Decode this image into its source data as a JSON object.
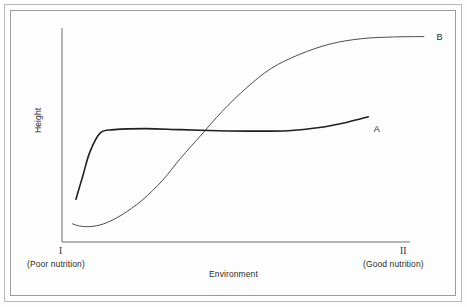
{
  "figure": {
    "background_color": "#fdfdfd",
    "frame_color": "#b9b9b9",
    "axis_color": "#6e6e6e"
  },
  "chart_data": {
    "type": "line",
    "title": "",
    "subtitle": "",
    "xlabel": "Environment",
    "ylabel": "Height",
    "grid": false,
    "legend": "none",
    "axis_ticks": "none",
    "xlim": [
      0,
      1
    ],
    "ylim": [
      0,
      1
    ],
    "x_tick_labels": [
      "I",
      "II"
    ],
    "x_tick_annotations": [
      "(Poor nutrition)",
      "(Good nutrition)"
    ],
    "annotations": [
      {
        "text": "A",
        "x": 0.89,
        "y": 0.53
      },
      {
        "text": "B",
        "x": 1.07,
        "y": 0.96
      }
    ],
    "series": [
      {
        "name": "A",
        "label": "A",
        "color": "#1f1f1f",
        "width": 1.6,
        "description": "Genotype A: low plasticity — rises sharply out of poor nutrition then stays nearly flat across environments",
        "x": [
          0.04,
          0.06,
          0.08,
          0.11,
          0.15,
          0.24,
          0.34,
          0.45,
          0.55,
          0.65,
          0.74,
          0.82,
          0.88
        ],
        "y": [
          0.2,
          0.31,
          0.42,
          0.51,
          0.525,
          0.53,
          0.525,
          0.52,
          0.518,
          0.52,
          0.535,
          0.56,
          0.585
        ]
      },
      {
        "name": "B",
        "label": "B",
        "color": "#4c4c4c",
        "width": 1.0,
        "description": "Genotype B: high plasticity — sigmoid response, lowest in poor nutrition, highest in good nutrition",
        "x": [
          0.03,
          0.05,
          0.08,
          0.12,
          0.17,
          0.23,
          0.29,
          0.34,
          0.4,
          0.46,
          0.53,
          0.6,
          0.68,
          0.77,
          0.86,
          0.95,
          1.04
        ],
        "y": [
          0.085,
          0.075,
          0.072,
          0.085,
          0.125,
          0.195,
          0.29,
          0.39,
          0.5,
          0.61,
          0.72,
          0.81,
          0.875,
          0.925,
          0.95,
          0.958,
          0.96
        ]
      }
    ],
    "crossover_point": {
      "x": 0.4,
      "y": 0.5
    }
  },
  "labels": {
    "y_axis": "Height",
    "x_axis": "Environment",
    "tick_left": "I",
    "tick_right": "II",
    "note_left": "(Poor nutrition)",
    "note_right": "(Good nutrition)",
    "curve_a": "A",
    "curve_b": "B"
  }
}
